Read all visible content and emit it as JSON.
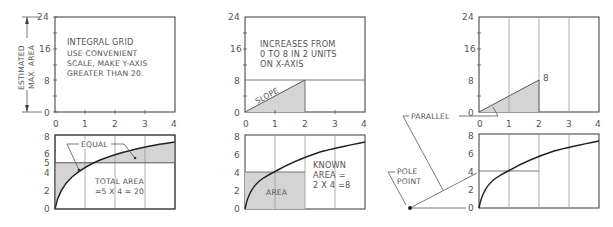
{
  "figure": {
    "panels": [
      {
        "id": "left",
        "top_chart": {
          "y_ticks": [
            "0",
            "8",
            "16",
            "24"
          ],
          "x_ticks": [
            "0",
            "1",
            "2",
            "3",
            "4"
          ],
          "note_title": "INTEGRAL GRID",
          "note_lines": [
            "USE CONVENIENT",
            "SCALE, MAKE Y-AXIS",
            "GREATER THAN 20."
          ],
          "dimension_label_1": "ESTIMATED",
          "dimension_label_2": "MAX. AREA"
        },
        "bottom_chart": {
          "y_ticks": [
            "0",
            "2",
            "4",
            "5",
            "6",
            "8"
          ],
          "equal_label": "EQUAL",
          "total_area_line1": "TOTAL AREA",
          "total_area_line2": "=5 X 4 = 20"
        }
      },
      {
        "id": "middle",
        "top_chart": {
          "y_ticks": [
            "0",
            "8",
            "16",
            "24"
          ],
          "x_ticks": [
            "0",
            "1",
            "2",
            "3",
            "4"
          ],
          "note_lines": [
            "INCREASES FROM",
            "0 TO 8 IN 2 UNITS",
            "ON X-AXIS"
          ],
          "slope_label": "SLOPE"
        },
        "bottom_chart": {
          "y_ticks": [
            "0",
            "2",
            "4",
            "6",
            "8"
          ],
          "area_label": "AREA",
          "known_area_lines": [
            "KNOWN",
            "AREA =",
            "2 X 4 =8"
          ]
        }
      },
      {
        "id": "right",
        "top_chart": {
          "y_ticks": [
            "0",
            "8",
            "16",
            "24"
          ],
          "x_ticks": [
            "0",
            "1",
            "2",
            "3",
            "4"
          ],
          "point_label": "8",
          "parallel_label": "PARALLEL"
        },
        "bottom_chart": {
          "y_ticks": [
            "0",
            "2",
            "4",
            "6",
            "8"
          ],
          "pole_label_1": "POLE",
          "pole_label_2": "POINT"
        }
      }
    ]
  },
  "colors": {
    "line": "#4a4a4a",
    "grid": "#9a9a9a",
    "shade": "#d4d4d4",
    "curve": "#222222",
    "text": "#555555"
  }
}
